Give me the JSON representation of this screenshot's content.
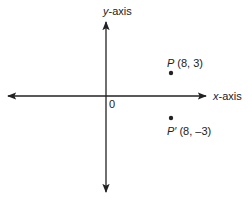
{
  "diagram": {
    "type": "coordinate-plane",
    "axes": {
      "x_label_var": "x",
      "x_label_suffix": "-axis",
      "y_label_var": "y",
      "y_label_suffix": "-axis",
      "origin_label": "0"
    },
    "points": [
      {
        "name": "P",
        "prime": "",
        "coords_text": "(8, 3)",
        "x": 8,
        "y": 3
      },
      {
        "name": "P",
        "prime": "′",
        "coords_text": "(8, –3)",
        "x": 8,
        "y": -3
      }
    ],
    "colors": {
      "ink": "#222222",
      "background": "#ffffff"
    }
  }
}
